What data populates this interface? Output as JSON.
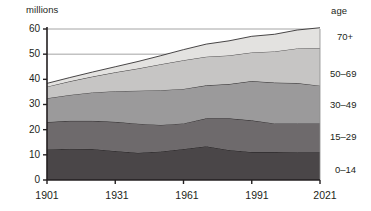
{
  "chart_data": {
    "type": "area",
    "title": "",
    "subtitle": "",
    "ylabel": "millions",
    "xlabel": "",
    "legend_title": "age",
    "legend_position": "right",
    "stacked": true,
    "grid": true,
    "gridlines_y": [
      50,
      60
    ],
    "x": [
      1901,
      1911,
      1921,
      1931,
      1941,
      1951,
      1961,
      1971,
      1981,
      1991,
      2001,
      2011,
      2021
    ],
    "xlim": [
      1901,
      2021
    ],
    "ylim": [
      0,
      60
    ],
    "yticks": [
      0,
      10,
      20,
      30,
      40,
      50,
      60
    ],
    "xticks": [
      1901,
      1931,
      1961,
      1991,
      2021
    ],
    "xtick_labels": [
      "1901",
      "1931",
      "1961",
      "1991",
      "2021"
    ],
    "ytick_labels": [
      "0",
      "10",
      "20",
      "30",
      "40",
      "50",
      "60"
    ],
    "series": [
      {
        "name": "0–14",
        "color": "#4a4648",
        "values": [
          12.1,
          12.4,
          12.3,
          11.5,
          10.8,
          11.3,
          12.3,
          13.4,
          11.9,
          11.1,
          11.1,
          11.0,
          11.0
        ]
      },
      {
        "name": "15–29",
        "color": "#6e6a6c",
        "values": [
          10.9,
          11.1,
          11.2,
          11.6,
          11.6,
          10.6,
          10.2,
          11.1,
          12.6,
          12.6,
          11.4,
          11.5,
          11.5
        ]
      },
      {
        "name": "30–49",
        "color": "#9b9a9b",
        "values": [
          9.5,
          10.3,
          11.3,
          12.2,
          13.1,
          13.8,
          13.7,
          13.1,
          13.6,
          15.6,
          16.2,
          16.0,
          15.0
        ]
      },
      {
        "name": "50–69",
        "color": "#c6c5c4",
        "values": [
          4.6,
          5.4,
          6.3,
          7.5,
          8.8,
          10.3,
          11.4,
          11.4,
          11.4,
          11.4,
          12.4,
          13.8,
          15.0
        ]
      },
      {
        "name": "70+",
        "color": "#e3e2e0",
        "values": [
          1.3,
          1.5,
          1.8,
          2.2,
          2.8,
          3.4,
          4.2,
          5.0,
          5.8,
          6.4,
          6.8,
          7.3,
          8.0
        ]
      }
    ],
    "totals": [
      38.4,
      40.7,
      42.9,
      45.0,
      47.1,
      49.4,
      51.8,
      54.0,
      55.3,
      57.1,
      57.9,
      59.6,
      60.5
    ],
    "series_labels_right": [
      "70+",
      "50–69",
      "30–49",
      "15–29",
      "0–14"
    ]
  },
  "axes": {
    "y_axis_title": "millions",
    "right_axis_title": "age"
  }
}
